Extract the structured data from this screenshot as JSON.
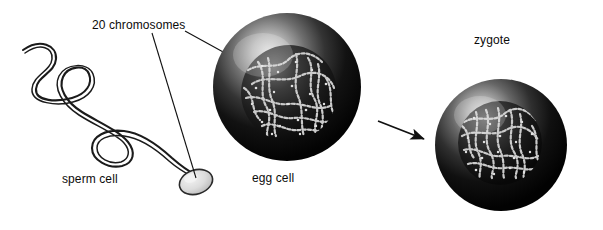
{
  "figure": {
    "background_color": "#ffffff",
    "width": 603,
    "height": 230
  },
  "labels": {
    "chromosomes": "20 chromosomes",
    "sperm_cell": "sperm cell",
    "egg_cell": "egg cell",
    "zygote": "zygote"
  },
  "colors": {
    "text": "#0b0b0b",
    "line": "#111111",
    "cell_dark": "#080808",
    "cell_mid": "#3a3a3a",
    "cell_highlight": "#d8d8d8",
    "nucleus_dark": "#141414",
    "chromosome_thread": "#cfcfcf",
    "sperm_head_fill": "#e2e2e2",
    "sperm_outline": "#2a2a2a"
  },
  "elements": {
    "sperm_cell": {
      "name": "sperm cell",
      "description": "long wavy flagellum with an oval head at lower right"
    },
    "egg_cell": {
      "name": "egg cell",
      "description": "large dark sphere with upper-left highlight and a nucleus of tangled chromosomes"
    },
    "zygote": {
      "name": "zygote",
      "description": "dark sphere with upper-left highlight and a nucleus with a denser tangle of chromosomes"
    },
    "arrow": {
      "name": "fertilization arrow",
      "direction": "egg cell to zygote"
    },
    "leader_lines": [
      {
        "from": "20 chromosomes label",
        "to": "sperm cell head"
      },
      {
        "from": "20 chromosomes label",
        "to": "egg cell nucleus"
      }
    ]
  }
}
